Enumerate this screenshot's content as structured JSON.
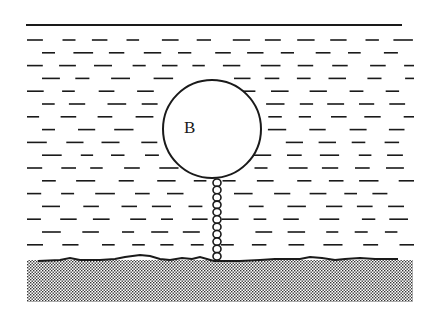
{
  "diagram": {
    "type": "physics-illustration",
    "water": {
      "surface_line": {
        "x1": 26,
        "x2": 402,
        "y": 25
      },
      "dash_color": "#1a1a1a"
    },
    "ball": {
      "label": "B",
      "cx": 212,
      "cy": 129,
      "r": 49
    },
    "chain": {
      "x": 217,
      "y_top": 179,
      "y_bottom": 260,
      "links": 11
    },
    "seabed": {
      "x": 27,
      "y": 258,
      "width": 386,
      "height": 44,
      "fill_pattern": "dotted-stipple"
    }
  }
}
